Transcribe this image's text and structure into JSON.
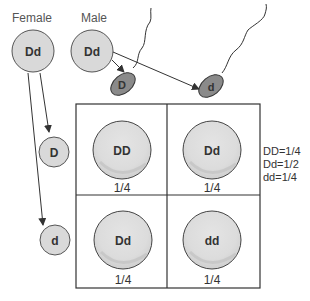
{
  "labels": {
    "female": "Female",
    "male": "Male"
  },
  "parents": {
    "female": {
      "genotype": "Dd"
    },
    "male": {
      "genotype": "Dd"
    }
  },
  "gametes": {
    "sperm": [
      {
        "allele": "D"
      },
      {
        "allele": "d"
      }
    ],
    "eggs": [
      {
        "allele": "D"
      },
      {
        "allele": "d"
      }
    ]
  },
  "punnett": {
    "cells": [
      {
        "genotype": "DD",
        "fraction": "1/4"
      },
      {
        "genotype": "Dd",
        "fraction": "1/4"
      },
      {
        "genotype": "Dd",
        "fraction": "1/4"
      },
      {
        "genotype": "dd",
        "fraction": "1/4"
      }
    ]
  },
  "ratios": [
    "DD=1/4",
    "Dd=1/2",
    "dd=1/4"
  ],
  "colors": {
    "circle_fill": "#d9d9d9",
    "circle_stroke": "#555555",
    "sperm_fill": "#8a8a8a",
    "grid_stroke": "#333333"
  }
}
